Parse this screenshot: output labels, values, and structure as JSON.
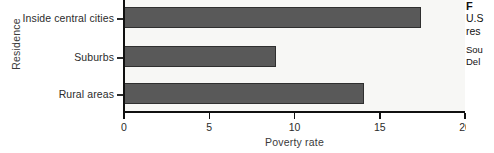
{
  "chart_data": {
    "type": "bar",
    "orientation": "horizontal",
    "title": "",
    "xlabel": "Poverty rate",
    "ylabel": "Residence",
    "categories": [
      "Inside central cities",
      "Suburbs",
      "Rural areas"
    ],
    "values": [
      17.4,
      8.9,
      14.1
    ],
    "xlim": [
      0,
      20
    ],
    "xticks": [
      0,
      5,
      10,
      15,
      20
    ],
    "xticklabels": [
      "0",
      "5",
      "10",
      "15",
      "20"
    ],
    "grid": false,
    "legend": null,
    "series": [
      {
        "name": "Poverty rate",
        "values": [
          17.4,
          8.9,
          14.1
        ]
      }
    ],
    "colors": {
      "bar_fill": "#595959",
      "bar_edge": "#2f2f2f",
      "plot_background": "#f7f7f5",
      "axis": "#101010",
      "text": "#2b2b2b",
      "page_background": "#ffffff"
    }
  },
  "sidenote": {
    "heading": "F",
    "line1": "U.S",
    "line2": "res",
    "source_line1": "Sou",
    "source_line2": "Del"
  }
}
